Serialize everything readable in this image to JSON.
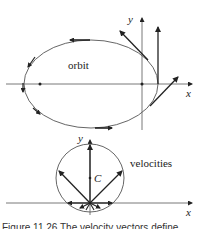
{
  "diagram": {
    "top": {
      "label": "orbit",
      "axis_x": "x",
      "axis_y": "y"
    },
    "bottom": {
      "label": "velocities",
      "center_label": "C",
      "axis_x": "x",
      "axis_y": "y"
    },
    "caption": "Figure 11.26    The velocity vectors define"
  },
  "colors": {
    "line": "#444444",
    "arrow": "#222222",
    "axis": "#555555"
  }
}
